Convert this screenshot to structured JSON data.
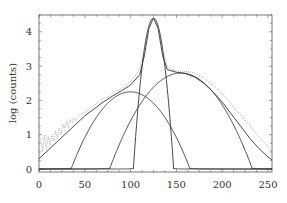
{
  "chart_data": {
    "type": "line",
    "title": "",
    "xlabel": "",
    "ylabel": "log (counts)",
    "xlim": [
      0,
      255
    ],
    "ylim": [
      0,
      4.5
    ],
    "x_ticks": [
      0,
      50,
      100,
      150,
      200,
      250
    ],
    "y_ticks": [
      0,
      1,
      2,
      3,
      4
    ],
    "grid": false,
    "legend": null,
    "series": [
      {
        "name": "narrow component",
        "style": "solid",
        "shape": "gaussian",
        "center": 125,
        "peak": 4.4,
        "half_width_at_zero": 22
      },
      {
        "name": "left broad component",
        "style": "solid",
        "shape": "gaussian",
        "center": 100,
        "peak": 2.25,
        "half_width_at_zero": 65
      },
      {
        "name": "right broad component",
        "style": "solid",
        "shape": "gaussian",
        "center": 155,
        "peak": 2.8,
        "half_width_at_zero": 78
      },
      {
        "name": "total fit",
        "style": "solid",
        "points": [
          [
            0,
            0.3
          ],
          [
            10,
            0.55
          ],
          [
            20,
            0.8
          ],
          [
            30,
            1.05
          ],
          [
            40,
            1.3
          ],
          [
            50,
            1.55
          ],
          [
            60,
            1.75
          ],
          [
            70,
            1.95
          ],
          [
            80,
            2.12
          ],
          [
            90,
            2.28
          ],
          [
            100,
            2.45
          ],
          [
            110,
            2.75
          ],
          [
            115,
            3.3
          ],
          [
            120,
            4.1
          ],
          [
            125,
            4.4
          ],
          [
            130,
            4.1
          ],
          [
            135,
            3.3
          ],
          [
            140,
            2.9
          ],
          [
            150,
            2.82
          ],
          [
            160,
            2.78
          ],
          [
            170,
            2.68
          ],
          [
            180,
            2.5
          ],
          [
            190,
            2.25
          ],
          [
            200,
            1.95
          ],
          [
            210,
            1.6
          ],
          [
            220,
            1.25
          ],
          [
            230,
            0.9
          ],
          [
            240,
            0.6
          ],
          [
            250,
            0.35
          ],
          [
            255,
            0.25
          ]
        ]
      },
      {
        "name": "data",
        "style": "dotted",
        "points": [
          [
            2,
            0.9
          ],
          [
            4,
            0.5
          ],
          [
            6,
            1.0
          ],
          [
            8,
            0.6
          ],
          [
            10,
            0.95
          ],
          [
            12,
            0.7
          ],
          [
            14,
            1.0
          ],
          [
            16,
            0.8
          ],
          [
            18,
            1.1
          ],
          [
            20,
            0.9
          ],
          [
            22,
            1.2
          ],
          [
            24,
            1.0
          ],
          [
            26,
            1.3
          ],
          [
            28,
            1.15
          ],
          [
            30,
            1.4
          ],
          [
            32,
            1.2
          ],
          [
            34,
            1.45
          ],
          [
            36,
            1.35
          ],
          [
            38,
            1.5
          ],
          [
            40,
            1.4
          ],
          [
            45,
            1.6
          ],
          [
            50,
            1.65
          ],
          [
            55,
            1.75
          ],
          [
            60,
            1.85
          ],
          [
            65,
            1.95
          ],
          [
            70,
            2.05
          ],
          [
            75,
            2.1
          ],
          [
            80,
            2.2
          ],
          [
            85,
            2.28
          ],
          [
            90,
            2.35
          ],
          [
            95,
            2.45
          ],
          [
            100,
            2.55
          ],
          [
            105,
            2.7
          ],
          [
            110,
            2.95
          ],
          [
            115,
            3.5
          ],
          [
            120,
            4.15
          ],
          [
            125,
            4.4
          ],
          [
            130,
            4.15
          ],
          [
            135,
            3.45
          ],
          [
            140,
            3.0
          ],
          [
            145,
            2.9
          ],
          [
            150,
            2.85
          ],
          [
            160,
            2.85
          ],
          [
            170,
            2.8
          ],
          [
            180,
            2.65
          ],
          [
            190,
            2.45
          ],
          [
            200,
            2.2
          ],
          [
            205,
            2.05
          ],
          [
            210,
            1.9
          ],
          [
            215,
            1.7
          ],
          [
            220,
            1.6
          ],
          [
            225,
            1.4
          ],
          [
            230,
            1.3
          ],
          [
            235,
            1.1
          ],
          [
            240,
            0.95
          ],
          [
            245,
            0.8
          ],
          [
            250,
            0.65
          ],
          [
            253,
            0.5
          ],
          [
            255,
            0.45
          ]
        ]
      }
    ]
  }
}
